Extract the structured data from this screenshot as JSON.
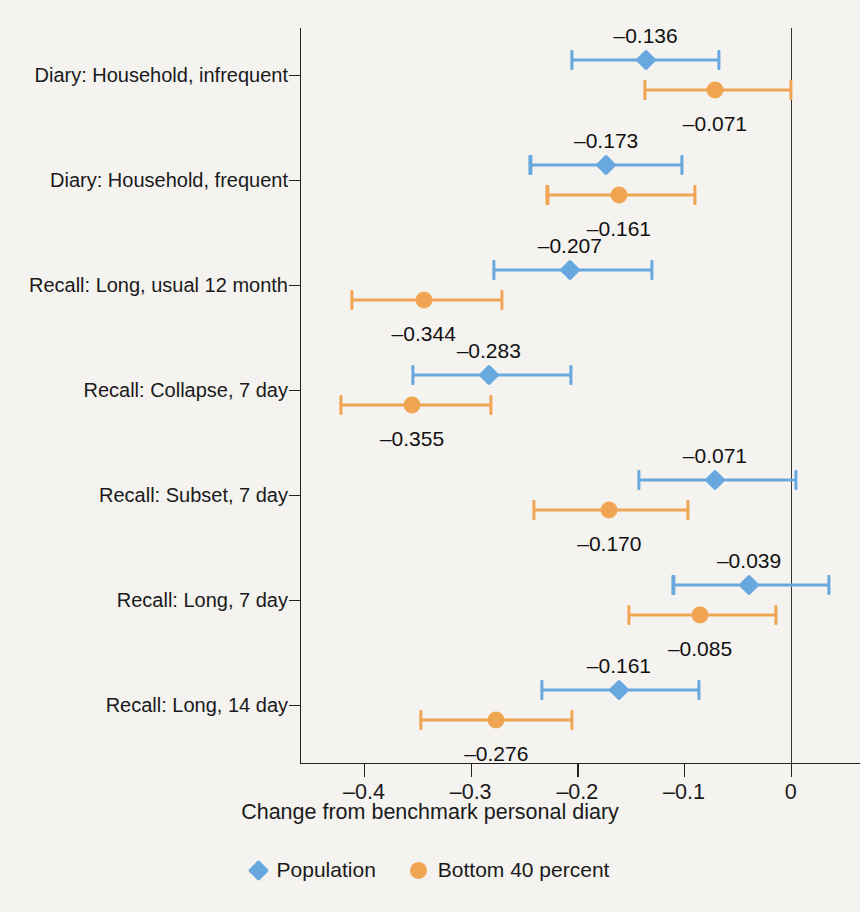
{
  "chart_data": {
    "type": "scatter",
    "title": "",
    "subtitle": "",
    "xlabel": "Change from benchmark personal diary",
    "ylabel": "",
    "xlim": [
      -0.46,
      0.065
    ],
    "xticks": [
      -0.4,
      -0.3,
      -0.2,
      -0.1,
      0
    ],
    "xticklabels": [
      "–0.4",
      "–0.3",
      "–0.2",
      "–0.1",
      "0"
    ],
    "grid": false,
    "legend_position": "bottom-center",
    "reference_line_x": 0,
    "categories": [
      "Diary: Household, infrequent",
      "Diary: Household, frequent",
      "Recall: Long, usual 12 month",
      "Recall: Collapse, 7 day",
      "Recall: Subset, 7 day",
      "Recall: Long, 7 day",
      "Recall: Long, 14 day"
    ],
    "series": [
      {
        "name": "Population",
        "color": "#68a8de",
        "marker": "diamond",
        "values": [
          -0.136,
          -0.173,
          -0.207,
          -0.283,
          -0.071,
          -0.039,
          -0.161
        ],
        "labels": [
          "–0.136",
          "–0.173",
          "–0.207",
          "–0.283",
          "–0.071",
          "–0.039",
          "–0.161"
        ],
        "ci_low": [
          -0.205,
          -0.244,
          -0.278,
          -0.354,
          -0.142,
          -0.11,
          -0.233
        ],
        "ci_high": [
          -0.067,
          -0.102,
          -0.13,
          -0.206,
          0.005,
          0.036,
          -0.086
        ]
      },
      {
        "name": "Bottom 40 percent",
        "color": "#f0a552",
        "marker": "circle",
        "values": [
          -0.071,
          -0.161,
          -0.344,
          -0.355,
          -0.17,
          -0.085,
          -0.276
        ],
        "labels": [
          "–0.071",
          "–0.161",
          "–0.344",
          "–0.355",
          "–0.170",
          "–0.085",
          "–0.276"
        ],
        "ci_low": [
          -0.137,
          -0.228,
          -0.411,
          -0.422,
          -0.241,
          -0.152,
          -0.347
        ],
        "ci_high": [
          0.0,
          -0.09,
          -0.271,
          -0.281,
          -0.096,
          -0.014,
          -0.205
        ]
      }
    ]
  },
  "legend": {
    "items": [
      {
        "label": "Population",
        "marker": "diamond",
        "color": "#68a8de"
      },
      {
        "label": "Bottom 40 percent",
        "marker": "circle",
        "color": "#f0a552"
      }
    ]
  },
  "axis": {
    "x_title": "Change from benchmark personal diary"
  }
}
